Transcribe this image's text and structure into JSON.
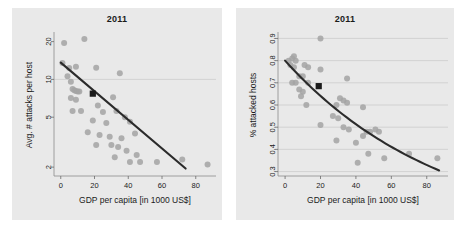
{
  "figure": {
    "background": "#ffffff",
    "panel_background": "#e9e9e9",
    "point_color": "#a3a3a3",
    "line_color": "#2b2b2b",
    "marker_color": "#1a1a1a",
    "grid_color": "#c9c9c9"
  },
  "panels": [
    {
      "id": "left",
      "title": "2011",
      "xlabel": "GDP per capita [in 1000 US$]",
      "ylabel": "Avg. # attacks per host"
    },
    {
      "id": "right",
      "title": "2011",
      "xlabel": "GDP per capita [in 1000 US$]",
      "ylabel": "% attacked hosts"
    }
  ],
  "chart_data": [
    {
      "type": "scatter",
      "panel": "left",
      "title": "2011",
      "xlabel": "GDP per capita [in 1000 US$]",
      "ylabel": "Avg. # attacks per host",
      "xlim": [
        -4,
        92
      ],
      "ylim": [
        1.7,
        23
      ],
      "yscale": "log",
      "xticks": [
        0,
        20,
        40,
        60,
        80
      ],
      "xticklabels": [
        "0",
        "20",
        "40",
        "60",
        "80"
      ],
      "yticks": [
        2,
        5,
        10,
        20
      ],
      "yticklabels": [
        "2",
        "5",
        "10",
        "20"
      ],
      "grid": "horizontal-at-10",
      "gridlines_y": [
        10
      ],
      "legend": "none",
      "points": [
        {
          "x": 2,
          "y": 19.5
        },
        {
          "x": 14,
          "y": 21.0
        },
        {
          "x": 1,
          "y": 13.5
        },
        {
          "x": 5,
          "y": 12.3
        },
        {
          "x": 9,
          "y": 12.6
        },
        {
          "x": 21,
          "y": 12.4
        },
        {
          "x": 35,
          "y": 11.2
        },
        {
          "x": 4,
          "y": 10.6
        },
        {
          "x": 6,
          "y": 9.6
        },
        {
          "x": 7,
          "y": 8.4
        },
        {
          "x": 8,
          "y": 8.2
        },
        {
          "x": 9,
          "y": 8.1
        },
        {
          "x": 10,
          "y": 8.0
        },
        {
          "x": 11,
          "y": 8.0
        },
        {
          "x": 6,
          "y": 7.1
        },
        {
          "x": 9,
          "y": 6.9
        },
        {
          "x": 31,
          "y": 7.2
        },
        {
          "x": 22,
          "y": 6.2
        },
        {
          "x": 7,
          "y": 5.6
        },
        {
          "x": 12,
          "y": 5.6
        },
        {
          "x": 25,
          "y": 5.5
        },
        {
          "x": 33,
          "y": 5.6
        },
        {
          "x": 38,
          "y": 5.0
        },
        {
          "x": 19,
          "y": 4.7
        },
        {
          "x": 27,
          "y": 4.5
        },
        {
          "x": 41,
          "y": 4.6
        },
        {
          "x": 16,
          "y": 3.8
        },
        {
          "x": 23,
          "y": 3.6
        },
        {
          "x": 29,
          "y": 3.5
        },
        {
          "x": 36,
          "y": 3.4
        },
        {
          "x": 44,
          "y": 3.7
        },
        {
          "x": 21,
          "y": 3.0
        },
        {
          "x": 30,
          "y": 3.0
        },
        {
          "x": 34,
          "y": 2.9
        },
        {
          "x": 39,
          "y": 2.7
        },
        {
          "x": 45,
          "y": 2.5
        },
        {
          "x": 32,
          "y": 2.4
        },
        {
          "x": 41,
          "y": 2.2
        },
        {
          "x": 47,
          "y": 2.2
        },
        {
          "x": 57,
          "y": 2.2
        },
        {
          "x": 72,
          "y": 2.3
        },
        {
          "x": 87,
          "y": 2.1
        }
      ],
      "fit_line": {
        "type": "linear-on-log",
        "x0": 0,
        "y0": 13.6,
        "x1": 74,
        "y1": 1.95
      },
      "highlight_marker": {
        "x": 19,
        "y": 7.7,
        "shape": "square",
        "color": "#1a1a1a"
      }
    },
    {
      "type": "scatter",
      "panel": "right",
      "title": "2011",
      "xlabel": "GDP per capita [in 1000 US$]",
      "ylabel": "% attacked hosts",
      "xlim": [
        -4,
        92
      ],
      "ylim": [
        0.28,
        0.92
      ],
      "yscale": "linear",
      "xticks": [
        0,
        20,
        40,
        60,
        80
      ],
      "xticklabels": [
        "0",
        "20",
        "40",
        "60",
        "80"
      ],
      "yticks": [
        0.3,
        0.4,
        0.5,
        0.6,
        0.7,
        0.8,
        0.9
      ],
      "yticklabels": [
        "0.3",
        "0.4",
        "0.5",
        "0.6",
        "0.7",
        "0.8",
        "0.9"
      ],
      "grid": "horizontal",
      "gridlines_y": [
        0.3,
        0.4,
        0.5,
        0.6,
        0.7,
        0.8,
        0.9
      ],
      "legend": "none",
      "points": [
        {
          "x": 20,
          "y": 0.9
        },
        {
          "x": 5,
          "y": 0.82
        },
        {
          "x": 2,
          "y": 0.8
        },
        {
          "x": 4,
          "y": 0.81
        },
        {
          "x": 6,
          "y": 0.8
        },
        {
          "x": 3,
          "y": 0.78
        },
        {
          "x": 5,
          "y": 0.77
        },
        {
          "x": 11,
          "y": 0.78
        },
        {
          "x": 13,
          "y": 0.77
        },
        {
          "x": 20,
          "y": 0.76
        },
        {
          "x": 8,
          "y": 0.73
        },
        {
          "x": 10,
          "y": 0.73
        },
        {
          "x": 4,
          "y": 0.7
        },
        {
          "x": 6,
          "y": 0.7
        },
        {
          "x": 13,
          "y": 0.7
        },
        {
          "x": 35,
          "y": 0.72
        },
        {
          "x": 8,
          "y": 0.67
        },
        {
          "x": 10,
          "y": 0.66
        },
        {
          "x": 9,
          "y": 0.64
        },
        {
          "x": 12,
          "y": 0.6
        },
        {
          "x": 31,
          "y": 0.63
        },
        {
          "x": 33,
          "y": 0.62
        },
        {
          "x": 35,
          "y": 0.61
        },
        {
          "x": 29,
          "y": 0.6
        },
        {
          "x": 44,
          "y": 0.59
        },
        {
          "x": 27,
          "y": 0.55
        },
        {
          "x": 30,
          "y": 0.54
        },
        {
          "x": 20,
          "y": 0.51
        },
        {
          "x": 33,
          "y": 0.5
        },
        {
          "x": 36,
          "y": 0.49
        },
        {
          "x": 46,
          "y": 0.48
        },
        {
          "x": 48,
          "y": 0.48
        },
        {
          "x": 51,
          "y": 0.49
        },
        {
          "x": 53,
          "y": 0.48
        },
        {
          "x": 44,
          "y": 0.46
        },
        {
          "x": 29,
          "y": 0.44
        },
        {
          "x": 40,
          "y": 0.43
        },
        {
          "x": 47,
          "y": 0.38
        },
        {
          "x": 56,
          "y": 0.36
        },
        {
          "x": 41,
          "y": 0.34
        },
        {
          "x": 70,
          "y": 0.38
        },
        {
          "x": 86,
          "y": 0.36
        }
      ],
      "fit_line": {
        "type": "curve-decreasing",
        "x0": 0,
        "y0": 0.8,
        "x1": 87,
        "y1": 0.305
      },
      "highlight_marker": {
        "x": 19,
        "y": 0.685,
        "shape": "square",
        "color": "#1a1a1a"
      }
    }
  ]
}
